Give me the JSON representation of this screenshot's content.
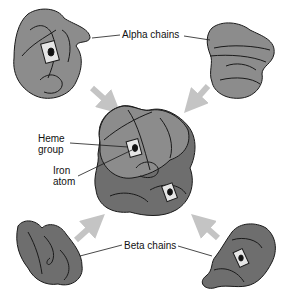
{
  "labels": {
    "alpha_chains": "Alpha chains",
    "heme_group_line1": "Heme",
    "heme_group_line2": "group",
    "iron_atom_line1": "Iron",
    "iron_atom_line2": "atom",
    "beta_chains": "Beta chains"
  },
  "components": [
    {
      "id": "alpha-chain-left",
      "type": "alpha",
      "has_heme": true
    },
    {
      "id": "alpha-chain-right",
      "type": "alpha",
      "has_heme": false
    },
    {
      "id": "hemoglobin-complex",
      "type": "assembled"
    },
    {
      "id": "beta-chain-left",
      "type": "beta",
      "has_heme": false
    },
    {
      "id": "beta-chain-right",
      "type": "beta",
      "has_heme": true
    }
  ],
  "colors": {
    "alpha": "#8c8c8c",
    "beta": "#6e6e6e",
    "arrow": "#c4c4c4",
    "outline": "#1a1a1a",
    "heme": "#e6e6e6"
  }
}
